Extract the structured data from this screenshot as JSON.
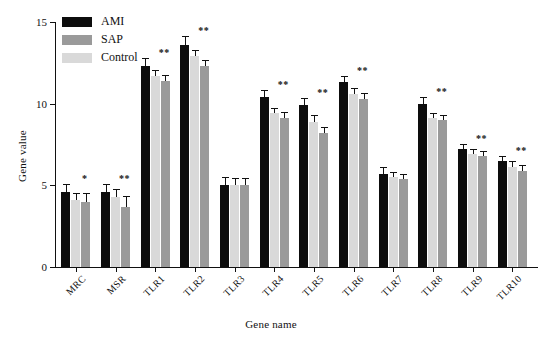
{
  "chart_data": {
    "type": "bar",
    "title": "",
    "xlabel": "Gene name",
    "ylabel": "Gene value",
    "ylim": [
      0,
      15
    ],
    "yticks": [
      0,
      5,
      10,
      15
    ],
    "grid": false,
    "legend_position": "top-left",
    "categories": [
      "MRC",
      "MSR",
      "TLR1",
      "TLR2",
      "TLR3",
      "TLR4",
      "TLR5",
      "TLR6",
      "TLR7",
      "TLR8",
      "TLR9",
      "TLR10"
    ],
    "series": [
      {
        "name": "AMI",
        "color": "#0d0d0d",
        "values": [
          4.6,
          4.6,
          12.3,
          13.6,
          5.0,
          10.4,
          9.9,
          11.3,
          5.7,
          10.0,
          7.2,
          6.5
        ],
        "errors": [
          0.45,
          0.4,
          0.45,
          0.5,
          0.45,
          0.4,
          0.4,
          0.35,
          0.35,
          0.35,
          0.25,
          0.25
        ]
      },
      {
        "name": "Control",
        "color": "#d9d9d9",
        "values": [
          4.1,
          4.3,
          11.7,
          12.9,
          5.0,
          9.4,
          8.9,
          10.6,
          5.5,
          9.1,
          6.9,
          6.1
        ],
        "errors": [
          0.4,
          0.4,
          0.3,
          0.35,
          0.4,
          0.3,
          0.35,
          0.3,
          0.25,
          0.25,
          0.25,
          0.3
        ]
      },
      {
        "name": "SAP",
        "color": "#9a9a9a",
        "values": [
          4.0,
          3.7,
          11.4,
          12.3,
          5.0,
          9.1,
          8.2,
          10.3,
          5.4,
          9.0,
          6.8,
          5.9
        ],
        "errors": [
          0.45,
          0.6,
          0.3,
          0.3,
          0.4,
          0.3,
          0.3,
          0.3,
          0.25,
          0.25,
          0.25,
          0.3
        ]
      }
    ],
    "significance": [
      "*",
      "**",
      "**",
      "**",
      "",
      "**",
      "**",
      "**",
      "",
      "**",
      "**",
      "**"
    ]
  },
  "legend": {
    "items": [
      {
        "label": "AMI",
        "color": "#0d0d0d"
      },
      {
        "label": "SAP",
        "color": "#9a9a9a"
      },
      {
        "label": "Control",
        "color": "#d9d9d9"
      }
    ]
  }
}
